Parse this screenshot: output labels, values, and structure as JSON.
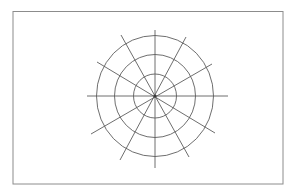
{
  "canvas": {
    "width": 296,
    "height": 195,
    "background": "#ffffff"
  },
  "frame": {
    "x": 13,
    "y": 11.5,
    "width": 270,
    "height": 172.5,
    "stroke": "#8c8c8c",
    "stroke_width": 1
  },
  "polar_grid": {
    "center": {
      "x": 155,
      "y": 96
    },
    "stroke": "#5e5e5e",
    "stroke_width": 0.9,
    "rings": [
      {
        "name": "inner-ring",
        "rx": 21.5,
        "ry": 22
      },
      {
        "name": "middle-ring",
        "rx": 40.5,
        "ry": 41.5
      },
      {
        "name": "outer-ring",
        "rx": 58.5,
        "ry": 60.5
      }
    ],
    "spokes": [
      {
        "name": "spoke-horizontal",
        "x1": 87,
        "y1": 96,
        "x2": 228,
        "y2": 96
      },
      {
        "name": "spoke-vertical",
        "x1": 155,
        "y1": 30,
        "x2": 155,
        "y2": 168
      },
      {
        "name": "spoke-60deg",
        "x1": 186,
        "y1": 37,
        "x2": 120,
        "y2": 160
      },
      {
        "name": "spoke-30deg",
        "x1": 212,
        "y1": 64,
        "x2": 91,
        "y2": 134
      },
      {
        "name": "spoke-120deg",
        "x1": 121,
        "y1": 35,
        "x2": 189,
        "y2": 157
      },
      {
        "name": "spoke-150deg",
        "x1": 97,
        "y1": 62,
        "x2": 215,
        "y2": 133
      }
    ],
    "center_dot": {
      "r": 1.6,
      "fill": "#3a3a3a"
    }
  }
}
